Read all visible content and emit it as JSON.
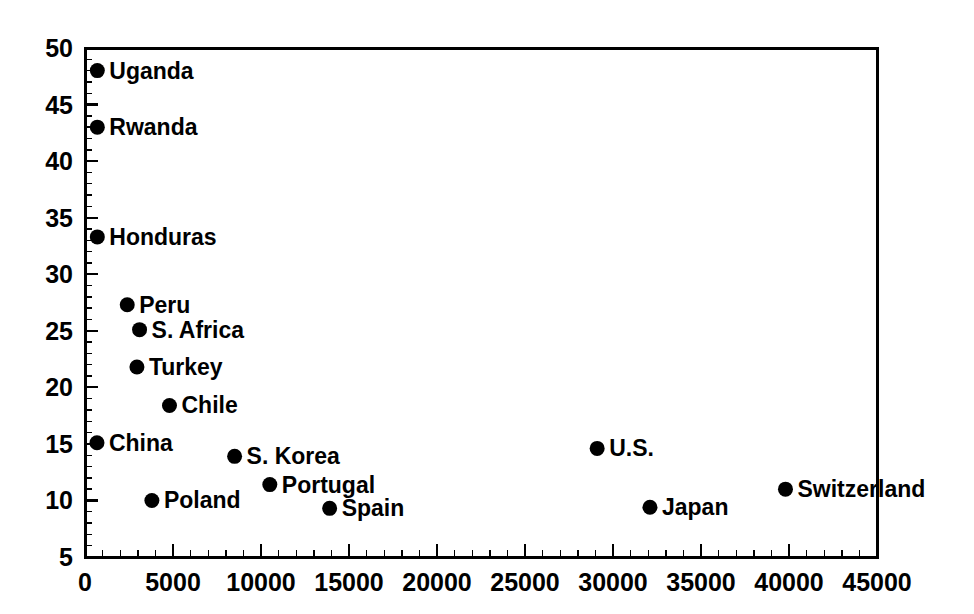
{
  "chart_data": {
    "type": "scatter",
    "title": "",
    "subtitle": "",
    "xlabel": "",
    "ylabel": "",
    "xlim": [
      0,
      45000
    ],
    "ylim": [
      5,
      50
    ],
    "grid": false,
    "legend": "none",
    "x_ticks": [
      "0",
      "5000",
      "10000",
      "15000",
      "20000",
      "25000",
      "30000",
      "35000",
      "40000",
      "45000"
    ],
    "x_tick_values": [
      0,
      5000,
      10000,
      15000,
      20000,
      25000,
      30000,
      35000,
      40000,
      45000
    ],
    "x_minor_step": 1000,
    "y_ticks": [
      "50",
      "45",
      "40",
      "35",
      "30",
      "25",
      "20",
      "15",
      "10",
      "5"
    ],
    "y_tick_values": [
      50,
      45,
      40,
      35,
      30,
      25,
      20,
      15,
      10,
      5
    ],
    "y_minor_step": 1,
    "marker_color": "#000000",
    "axis_color": "#000000",
    "background_color": "#ffffff",
    "points": [
      {
        "label": "Uganda",
        "x": 700,
        "y": 48.0,
        "label_dx": 12,
        "label_dy": 8
      },
      {
        "label": "Rwanda",
        "x": 700,
        "y": 43.0,
        "label_dx": 12,
        "label_dy": 8
      },
      {
        "label": "Honduras",
        "x": 700,
        "y": 33.3,
        "label_dx": 12,
        "label_dy": 8
      },
      {
        "label": "Peru",
        "x": 2400,
        "y": 27.3,
        "label_dx": 12,
        "label_dy": 8
      },
      {
        "label": "S. Africa",
        "x": 3100,
        "y": 25.1,
        "label_dx": 12,
        "label_dy": 8
      },
      {
        "label": "Turkey",
        "x": 2950,
        "y": 21.8,
        "label_dx": 12,
        "label_dy": 8
      },
      {
        "label": "Chile",
        "x": 4800,
        "y": 18.4,
        "label_dx": 12,
        "label_dy": 8
      },
      {
        "label": "China",
        "x": 680,
        "y": 15.1,
        "label_dx": 12,
        "label_dy": 8
      },
      {
        "label": "S. Korea",
        "x": 8500,
        "y": 13.9,
        "label_dx": 12,
        "label_dy": 8
      },
      {
        "label": "Portugal",
        "x": 10500,
        "y": 11.4,
        "label_dx": 12,
        "label_dy": 8
      },
      {
        "label": "Poland",
        "x": 3800,
        "y": 10.0,
        "label_dx": 12,
        "label_dy": 8
      },
      {
        "label": "Spain",
        "x": 13900,
        "y": 9.3,
        "label_dx": 12,
        "label_dy": 8
      },
      {
        "label": "U.S.",
        "x": 29100,
        "y": 14.6,
        "label_dx": 12,
        "label_dy": 8
      },
      {
        "label": "Japan",
        "x": 32100,
        "y": 9.4,
        "label_dx": 12,
        "label_dy": 8
      },
      {
        "label": "Switzerland",
        "x": 39800,
        "y": 11.0,
        "label_dx": 12,
        "label_dy": 8
      }
    ]
  }
}
